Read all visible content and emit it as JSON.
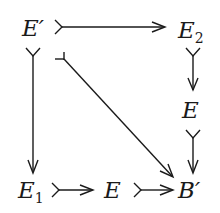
{
  "diagram": {
    "type": "commutative-diagram",
    "nodes": {
      "e_prime": {
        "label": "E",
        "mark": "′"
      },
      "e2": {
        "label": "E",
        "sub": "2"
      },
      "e_right": {
        "label": "E"
      },
      "e1": {
        "label": "E",
        "sub": "1"
      },
      "e_bottom": {
        "label": "E"
      },
      "b_prime": {
        "label": "B",
        "mark": "′"
      }
    },
    "arrows": [
      {
        "from": "E′",
        "to": "E₂",
        "style": "monomorphism"
      },
      {
        "from": "E′",
        "to": "E₁",
        "style": "monomorphism"
      },
      {
        "from": "E′",
        "to": "B′",
        "style": "monomorphism (diagonal)"
      },
      {
        "from": "E₂",
        "to": "E",
        "style": "monomorphism"
      },
      {
        "from": "E",
        "to": "B′",
        "style": "monomorphism"
      },
      {
        "from": "E₁",
        "to": "E",
        "style": "monomorphism"
      },
      {
        "from": "E",
        "to": "B′",
        "style": "monomorphism"
      }
    ]
  }
}
